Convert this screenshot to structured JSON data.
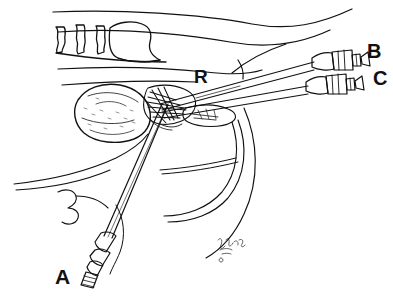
{
  "figure": {
    "domain": "illustration",
    "kind": "surgical-line-art",
    "background_color": "#ffffff",
    "ink_color": "#111111",
    "width": 393,
    "height": 298
  },
  "labels": {
    "a": "A",
    "b": "B",
    "c": "C",
    "r": "R"
  },
  "label_meanings": {
    "a": "instrument handle entering from lower left",
    "b": "upper instrument handle at right",
    "c": "lower instrument handle at right",
    "r": "annotated anatomical structure at center (retractor/rib region)"
  },
  "elements": {
    "rib_cage": "ribs and costal cartilage, upper left",
    "body_contour_upper": "torso outline sweeping to upper right",
    "organ": "rounded organ mass at center left",
    "surgical_site": "dense cross-hatched dissection area at center",
    "instrument_a_shaft": "shaft descending diagonally to lower-left handle",
    "instrument_b_shaft": "upper shaft running to upper-right handle",
    "instrument_c_shaft": "lower shaft running to right handle",
    "abdominal_wall": "lower-left fascia and wall contours",
    "diaphragm_curve": "large curved contour at lower center right",
    "signature": "artist cursive signature, lower center"
  }
}
